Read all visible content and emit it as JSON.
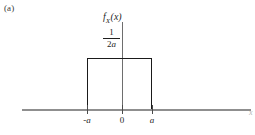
{
  "figure": {
    "panel_label": "(a)",
    "background_color": "#ffffff"
  },
  "chart_data": {
    "type": "area",
    "title": "",
    "subtitle": "",
    "xlabel": "x",
    "ylabel": "f_X(x)",
    "ylabel_parts": {
      "base": "f",
      "subscript": "X",
      "argument": "(x)"
    },
    "x": [
      -1.65,
      -1.0,
      -1.0,
      1.0,
      1.0,
      1.9
    ],
    "y": [
      0,
      0,
      1,
      1,
      0,
      0
    ],
    "plateau_value_label": "1/2a",
    "plateau_numerator": "1",
    "plateau_denominator": "2a",
    "plateau_denominator_coefficient": "2",
    "plateau_denominator_variable": "a",
    "support_start_label": "-a",
    "support_end_label": "a",
    "origin_label": "0",
    "xticks": [
      "-a",
      "0",
      "a"
    ],
    "xtick_values": [
      -1,
      0,
      1
    ],
    "yticks": [
      "1/2a"
    ],
    "ytick_values": [
      1
    ],
    "xlim": [
      -1.85,
      2.35
    ],
    "ylim": [
      0,
      1.7
    ],
    "grid": false,
    "legend": null,
    "legend_position": "none",
    "series": [
      {
        "name": "f_X(x)",
        "values": [
          0,
          0,
          1,
          1,
          0,
          0
        ],
        "line_color": "#1a1a1a",
        "fill": "none"
      }
    ],
    "axis_color": "#8f8f8f",
    "curve_color": "#1a1a1a"
  }
}
